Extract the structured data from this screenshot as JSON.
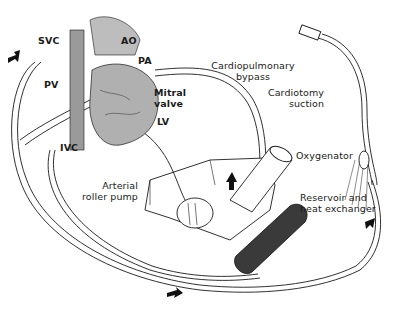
{
  "diagram": {
    "type": "medical-illustration",
    "labels": {
      "svc": "SVC",
      "ao": "AO",
      "pa": "PA",
      "pv": "PV",
      "ivc": "IVC",
      "mitral_valve_line1": "Mitral",
      "mitral_valve_line2": "valve",
      "lv": "LV",
      "cpb_line1": "Cardiopulmonary",
      "cpb_line2": "bypass",
      "suction_line1": "Cardiotomy",
      "suction_line2": "suction",
      "oxygenator": "Oxygenator",
      "pump_line1": "Arterial",
      "pump_line2": "roller pump",
      "reservoir_line1": "Reservoir and",
      "reservoir_line2": "heat exchanger"
    },
    "flow_arrows": 4,
    "colors": {
      "ink": "#1a1a1a",
      "tube": "#ffffff",
      "reservoir": "#3a3a3a",
      "heart_shade": "#8a8a8a"
    }
  }
}
